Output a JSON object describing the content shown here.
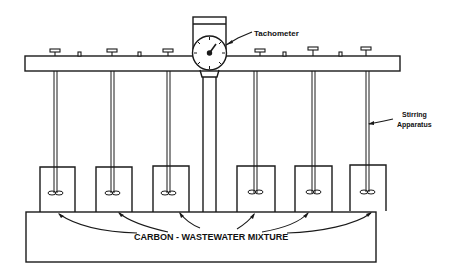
{
  "diagram": {
    "labels": {
      "tachometer": "Tachometer",
      "stirring_line1": "Stirring",
      "stirring_line2": "Apparatus",
      "mixture": "CARBON - WASTEWATER MIXTURE"
    },
    "colors": {
      "stroke": "#1a1a1a",
      "background": "#ffffff"
    },
    "beaker_count": 6
  }
}
